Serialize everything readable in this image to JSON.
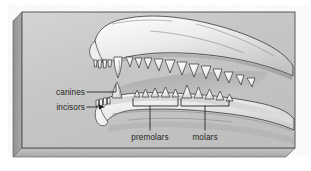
{
  "figure": {
    "style": "grayscale shaded illustration on a three-dimensional slab",
    "background_color": "#ffffff",
    "slab": {
      "face_color": "#c9c9c9",
      "left_bevel_color": "#9a9a9a",
      "bottom_bevel_color": "#b4b4b4",
      "border_color": "#4a4a4a"
    },
    "ink_color": "#1c1c1c",
    "tooth_color": "#f2f2f2",
    "jaw_color": "#d7d7d7"
  },
  "labels": {
    "canines": "canines",
    "incisors": "incisors",
    "premolars": "premolars",
    "molars": "molars"
  },
  "annotations": [
    {
      "name": "canines",
      "text": "canines",
      "connector": "line",
      "points_to": "lower canine tooth"
    },
    {
      "name": "incisors",
      "text": "incisors",
      "connector": "arrow",
      "points_to": "lower incisor teeth"
    },
    {
      "name": "premolars",
      "text": "premolars",
      "connector": "bracket",
      "points_to": "lower premolar tooth row"
    },
    {
      "name": "molars",
      "text": "molars",
      "connector": "bracket",
      "points_to": "lower molar tooth row"
    }
  ]
}
